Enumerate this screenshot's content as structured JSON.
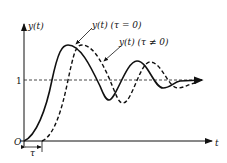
{
  "diagram": {
    "axes": {
      "y_label": "y(t)",
      "x_label": "t",
      "origin_label": "O",
      "reference_level_label": "1"
    },
    "curves": [
      {
        "name": "no-delay",
        "label": "y(t) (τ = 0)",
        "style": "solid"
      },
      {
        "name": "with-delay",
        "label": "y(t) (τ ≠ 0)",
        "style": "dashed"
      }
    ],
    "delay_marker_label": "τ",
    "colors": {
      "ink": "#111111",
      "background": "#ffffff"
    }
  }
}
